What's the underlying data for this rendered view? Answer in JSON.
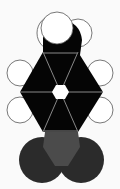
{
  "diagram": {
    "colors": {
      "background": "#fafafa",
      "black": "#050505",
      "gray_pentagon": "#4b4b4b",
      "dark_sphere": "#2b2b2b",
      "outline": "#555555",
      "white": "#ffffff"
    }
  }
}
